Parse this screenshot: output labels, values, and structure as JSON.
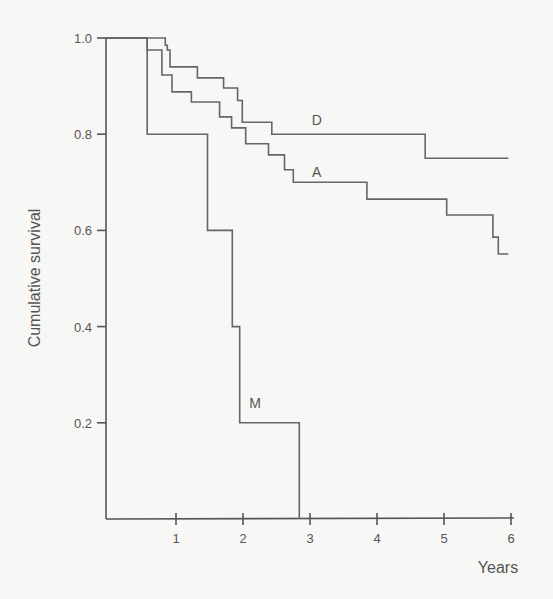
{
  "chart_data": {
    "type": "line",
    "subtype": "kaplan-meier step",
    "title": "",
    "xlabel": "Years",
    "ylabel": "Cumulative survival",
    "xlim": [
      0,
      6
    ],
    "ylim": [
      0,
      1.0
    ],
    "x_ticks": [
      1,
      2,
      3,
      4,
      5,
      6
    ],
    "y_ticks": [
      0.2,
      0.4,
      0.6,
      0.8,
      1.0
    ],
    "y_tick_labels": [
      "0.2",
      "0.4",
      "0.6",
      "0.8",
      "1.0"
    ],
    "grid": false,
    "legend": "inline labels",
    "series": [
      {
        "name": "D",
        "steps": [
          [
            0,
            1.0
          ],
          [
            0.84,
            0.985
          ],
          [
            0.87,
            0.975
          ],
          [
            0.91,
            0.94
          ],
          [
            1.32,
            0.917
          ],
          [
            1.71,
            0.896
          ],
          [
            1.92,
            0.87
          ],
          [
            1.99,
            0.825
          ],
          [
            2.43,
            0.8
          ],
          [
            4.72,
            0.75
          ]
        ],
        "end_x": 5.96,
        "label_pos": [
          3.1,
          0.82
        ]
      },
      {
        "name": "A",
        "steps": [
          [
            0,
            1.0
          ],
          [
            0.57,
            0.975
          ],
          [
            0.79,
            0.923
          ],
          [
            0.94,
            0.888
          ],
          [
            1.23,
            0.867
          ],
          [
            1.65,
            0.836
          ],
          [
            1.83,
            0.813
          ],
          [
            2.04,
            0.78
          ],
          [
            2.38,
            0.757
          ],
          [
            2.62,
            0.726
          ],
          [
            2.75,
            0.7
          ],
          [
            3.85,
            0.665
          ],
          [
            5.04,
            0.632
          ],
          [
            5.73,
            0.586
          ],
          [
            5.81,
            0.551
          ]
        ],
        "end_x": 5.96,
        "label_pos": [
          3.1,
          0.71
        ]
      },
      {
        "name": "M",
        "steps": [
          [
            0,
            1.0
          ],
          [
            0.57,
            0.8
          ],
          [
            1.47,
            0.6
          ],
          [
            1.84,
            0.4
          ],
          [
            1.95,
            0.2
          ],
          [
            2.84,
            0.0
          ]
        ],
        "end_x": 2.84,
        "label_pos": [
          2.18,
          0.23
        ]
      }
    ]
  },
  "labels": {
    "ylabel": "Cumulative survival",
    "xlabel": "Years"
  }
}
